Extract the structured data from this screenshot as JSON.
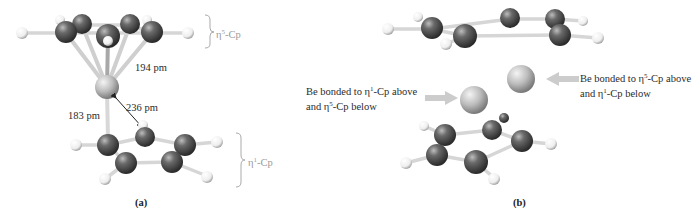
{
  "panel_a": {
    "label": "(a)",
    "eta5_label": {
      "eta": "η",
      "sup": "5",
      "rest": "-Cp"
    },
    "eta1_label": {
      "eta": "η",
      "sup": "1",
      "rest": "-Cp"
    },
    "dist_194": "194 pm",
    "dist_236": "236 pm",
    "dist_183": "183 pm"
  },
  "panel_b": {
    "label": "(b)",
    "left_note": {
      "line1_pre": "Be bonded to η",
      "line1_sup": "1",
      "line1_post": "-Cp above",
      "line2_pre": "and η",
      "line2_sup": "5",
      "line2_post": "-Cp below"
    },
    "right_note": {
      "line1_pre": "Be bonded to η",
      "line1_sup": "5",
      "line1_post": "-Cp above",
      "line2_pre": "and η",
      "line2_sup": "1",
      "line2_post": "-Cp below"
    }
  },
  "colors": {
    "carbon": "#4a4a4a",
    "hydrogen": "#f2f2f2",
    "beryllium": "#c8c8c8",
    "bond": "#d8d8d8",
    "arrow": "#cccccc",
    "bracket": "#aaaaaa"
  }
}
